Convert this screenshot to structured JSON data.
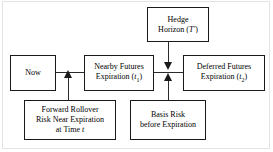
{
  "diagram": {
    "nodes": [
      {
        "id": "hedge-horizon",
        "label": "Hedge\nHorizon (T′)",
        "line1": "Hedge",
        "line2_prefix": "Horizon (",
        "line2_symbol": "T′",
        "line2_suffix": ")"
      },
      {
        "id": "now",
        "label": "Now"
      },
      {
        "id": "nearby-futures",
        "label": "Nearby Futures\nExpiration (t₁)",
        "line1": "Nearby Futures",
        "line2_prefix": "Expiration (",
        "line2_symbol": "t",
        "line2_subscript": "1",
        "line2_suffix": ")"
      },
      {
        "id": "deferred-futures",
        "label": "Deferred Futures\nExpiration (t₂)",
        "line1": "Deferred Futures",
        "line2_prefix": "Expiration (",
        "line2_symbol": "t",
        "line2_subscript": "2",
        "line2_suffix": ")"
      },
      {
        "id": "forward-rollover",
        "label": "Forward Rollover\nRisk Near Expiration\nat Time t",
        "line1": "Forward Rollover",
        "line2": "Risk Near Expiration",
        "line3_prefix": "at Time ",
        "line3_symbol": "t"
      },
      {
        "id": "basis-risk",
        "label": "Basis Risk\nbefore Expiration",
        "line1": "Basis Risk",
        "line2": "before Expiration"
      }
    ],
    "edges": [
      {
        "id": "now-to-nearby",
        "from": "now",
        "to": "nearby-futures",
        "style": "plain-line",
        "orientation": "horizontal"
      },
      {
        "id": "nearby-to-deferred",
        "from": "nearby-futures",
        "to": "deferred-futures",
        "style": "plain-line",
        "orientation": "horizontal"
      },
      {
        "id": "hedge-to-timeline",
        "from": "hedge-horizon",
        "to": "timeline",
        "style": "arrow-down",
        "orientation": "vertical"
      },
      {
        "id": "basis-to-timeline",
        "from": "basis-risk",
        "to": "timeline",
        "style": "arrow-up",
        "orientation": "vertical"
      },
      {
        "id": "rollover-to-timeline",
        "from": "forward-rollover",
        "to": "timeline",
        "style": "arrow-up",
        "orientation": "vertical"
      }
    ],
    "colors": {
      "node_border": "#1a1a1a",
      "edge": "#2b2b2b",
      "background": "#ffffff",
      "text": "#000000"
    }
  }
}
